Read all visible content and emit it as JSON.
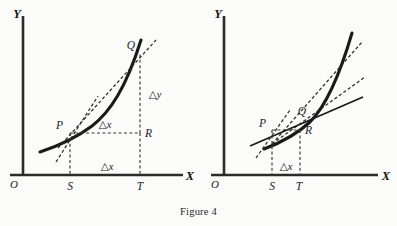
{
  "figure": {
    "caption": "Figure 4",
    "background_color": "#fbfbf9",
    "ink_color": "#1a1a1a",
    "panel_count": 2
  },
  "panels": [
    {
      "id": "left-panel",
      "name": "average-rate-of-change-panel",
      "description": "Curve with a single secant line PQ and the tangent at P; right triangle PRQ shows delta-x and delta-y.",
      "axes": {
        "y_label": "Y",
        "x_label": "X",
        "origin_label": "O"
      },
      "points": [
        {
          "key": "P",
          "label": "P"
        },
        {
          "key": "Q",
          "label": "Q"
        },
        {
          "key": "R",
          "label": "R"
        },
        {
          "key": "S",
          "label": "S"
        },
        {
          "key": "T",
          "label": "T"
        }
      ],
      "annotations": [
        {
          "key": "dx_upper",
          "tri": "△",
          "var": "x"
        },
        {
          "key": "dy_right",
          "tri": "△",
          "var": "y"
        },
        {
          "key": "dx_lower",
          "tri": "△",
          "var": "x"
        }
      ],
      "lines": [
        {
          "key": "curve",
          "style": "solid-thick",
          "role": "function-curve"
        },
        {
          "key": "secant-PQ",
          "style": "dashed",
          "role": "secant-line"
        },
        {
          "key": "tangent-P",
          "style": "dashed",
          "role": "tangent-line-at-P"
        },
        {
          "key": "leg-PR",
          "style": "dashed",
          "role": "horizontal-leg"
        },
        {
          "key": "leg-RQ",
          "style": "dashed",
          "role": "vertical-leg"
        },
        {
          "key": "drop-S",
          "style": "dashed",
          "role": "ordinate-at-S"
        },
        {
          "key": "drop-T",
          "style": "dashed",
          "role": "ordinate-at-T"
        }
      ]
    },
    {
      "id": "right-panel",
      "name": "limiting-secant-panel",
      "description": "Same curve with Q moved closer to P; several secant lines approach the tangent at P. Only the small delta-x is marked.",
      "axes": {
        "y_label": "Y",
        "x_label": "X",
        "origin_label": "O"
      },
      "points": [
        {
          "key": "P",
          "label": "P"
        },
        {
          "key": "Q",
          "label": "Q"
        },
        {
          "key": "R",
          "label": "R"
        },
        {
          "key": "S",
          "label": "S"
        },
        {
          "key": "T",
          "label": "T"
        }
      ],
      "annotations": [
        {
          "key": "dx_lower",
          "tri": "△",
          "var": "x"
        }
      ],
      "lines": [
        {
          "key": "curve",
          "style": "solid-thick",
          "role": "function-curve"
        },
        {
          "key": "secant-1",
          "style": "dashed",
          "role": "secant-line-far"
        },
        {
          "key": "secant-2",
          "style": "dashed",
          "role": "secant-line-near"
        },
        {
          "key": "tangent-P",
          "style": "solid-thin",
          "role": "tangent-line-at-P"
        },
        {
          "key": "tangent-dashed-P",
          "style": "dashed",
          "role": "tangent-extension-below-P"
        },
        {
          "key": "leg-PR",
          "style": "dashed",
          "role": "horizontal-leg"
        },
        {
          "key": "drop-S",
          "style": "dashed",
          "role": "ordinate-at-S"
        },
        {
          "key": "drop-T",
          "style": "dashed",
          "role": "ordinate-at-T"
        }
      ]
    }
  ]
}
